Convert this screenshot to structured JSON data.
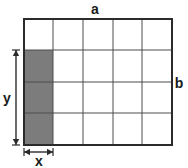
{
  "figure": {
    "kind": "rectangle-area-grid-diagram",
    "background_color": "#ffffff",
    "grid": {
      "columns": 5,
      "rows": 4,
      "outer_line_color": "#2b2b2b",
      "inner_line_color": "#4d4d4d",
      "outer_line_width": 2,
      "inner_line_width": 1,
      "left_px": 24,
      "top_px": 19,
      "right_px": 172,
      "bottom_px": 145,
      "vertical_lines_px": [
        24,
        53,
        83,
        113,
        142,
        172
      ],
      "horizontal_lines_px": [
        19,
        50,
        82,
        113,
        145
      ]
    },
    "shaded_region": {
      "fill_color": "#7c7c7c",
      "column_index": 0,
      "row_start_index": 1,
      "row_end_index": 4,
      "x_px": 24,
      "y_px": 50,
      "width_px": 29,
      "height_px": 95,
      "cells_count": 3
    },
    "labels": {
      "top": "a",
      "right": "b",
      "left": "y",
      "bottom": "x"
    },
    "dimension_arrows": {
      "color": "#2b2b2b",
      "vertical": {
        "label": "y",
        "x_px": 16,
        "y_start_px": 50,
        "y_end_px": 145
      },
      "horizontal": {
        "label": "x",
        "y_px": 152,
        "x_start_px": 24,
        "x_end_px": 53
      }
    }
  }
}
